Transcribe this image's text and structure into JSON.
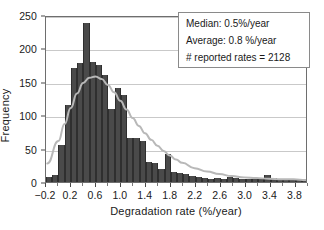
{
  "chart_data": {
    "type": "bar",
    "title": "",
    "subtitle": "",
    "xlabel": "Degradation rate (%/year)",
    "ylabel": "Frequency",
    "xlim": [
      -0.2,
      4.0
    ],
    "ylim": [
      0,
      250
    ],
    "grid": true,
    "bin_width": 0.1,
    "bar_color": "#4a4a4a",
    "curve_color": "#b8b8b8",
    "xticks": [
      "-0.2",
      "0.2",
      "0.6",
      "1.0",
      "1.4",
      "1.8",
      "2.2",
      "2.6",
      "3.0",
      "3.4",
      "3.8"
    ],
    "xtick_values": [
      -0.2,
      0.2,
      0.6,
      1.0,
      1.4,
      1.8,
      2.2,
      2.6,
      3.0,
      3.4,
      3.8
    ],
    "yticks": [
      "0",
      "50",
      "100",
      "150",
      "200",
      "250"
    ],
    "ytick_values": [
      0,
      50,
      100,
      150,
      200,
      250
    ],
    "bin_centers": [
      -0.15,
      -0.05,
      0.05,
      0.15,
      0.25,
      0.35,
      0.45,
      0.55,
      0.65,
      0.75,
      0.85,
      0.95,
      1.05,
      1.15,
      1.25,
      1.35,
      1.45,
      1.55,
      1.65,
      1.75,
      1.85,
      1.95,
      2.05,
      2.15,
      2.25,
      2.35,
      2.45,
      2.55,
      2.65,
      2.75,
      2.85,
      2.95,
      3.05,
      3.15,
      3.25,
      3.35,
      3.45,
      3.55,
      3.65,
      3.75,
      3.85,
      3.95
    ],
    "values": [
      8,
      10,
      55,
      115,
      170,
      178,
      238,
      180,
      175,
      160,
      110,
      140,
      130,
      66,
      66,
      62,
      30,
      28,
      20,
      42,
      15,
      14,
      12,
      9,
      8,
      6,
      5,
      6,
      4,
      7,
      6,
      5,
      5,
      4,
      5,
      10,
      6,
      5,
      5,
      4,
      3,
      2
    ],
    "series": [
      {
        "name": "Lognormal fit",
        "type": "line",
        "x": [
          -0.18,
          0.0,
          0.1,
          0.2,
          0.3,
          0.4,
          0.5,
          0.6,
          0.7,
          0.8,
          0.9,
          1.0,
          1.1,
          1.2,
          1.3,
          1.4,
          1.5,
          1.6,
          1.7,
          1.8,
          1.9,
          2.0,
          2.2,
          2.4,
          2.6,
          2.8,
          3.0,
          3.2,
          3.4,
          3.6,
          3.8,
          4.0
        ],
        "values": [
          28,
          62,
          88,
          112,
          134,
          150,
          158,
          160,
          156,
          147,
          136,
          123,
          110,
          97,
          85,
          74,
          64,
          55,
          47,
          40,
          34,
          29,
          21,
          16,
          12,
          9,
          7,
          6,
          5,
          4,
          4,
          3
        ]
      }
    ],
    "annotations": [
      "Median: 0.5%/year",
      "Average: 0.8 %/year",
      "# reported rates = 2128"
    ]
  },
  "stats_box": {
    "median": "Median: 0.5%/year",
    "average": "Average: 0.8 %/year",
    "count": "# reported rates = 2128"
  }
}
